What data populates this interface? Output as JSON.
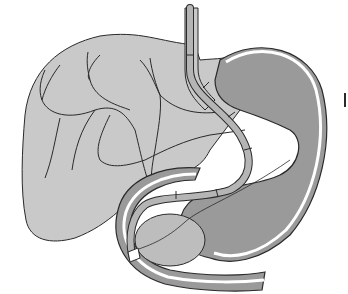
{
  "figure": {
    "type": "anatomical illustration",
    "structures": [
      "liver",
      "biliary-tree",
      "gallbladder-region",
      "esophagus",
      "stomach",
      "duodenum",
      "pancreas-head",
      "endoscope",
      "catheter"
    ],
    "colors": {
      "background": "#ffffff",
      "liver_fill": "#c9c9c9",
      "stomach_fill": "#9a9a9a",
      "outline": "#2a2a2a",
      "wall": "#ffffff",
      "pancreas_fill": "#bdbdbd",
      "endoscope_fill": "#b5b5b5"
    },
    "labels": []
  }
}
